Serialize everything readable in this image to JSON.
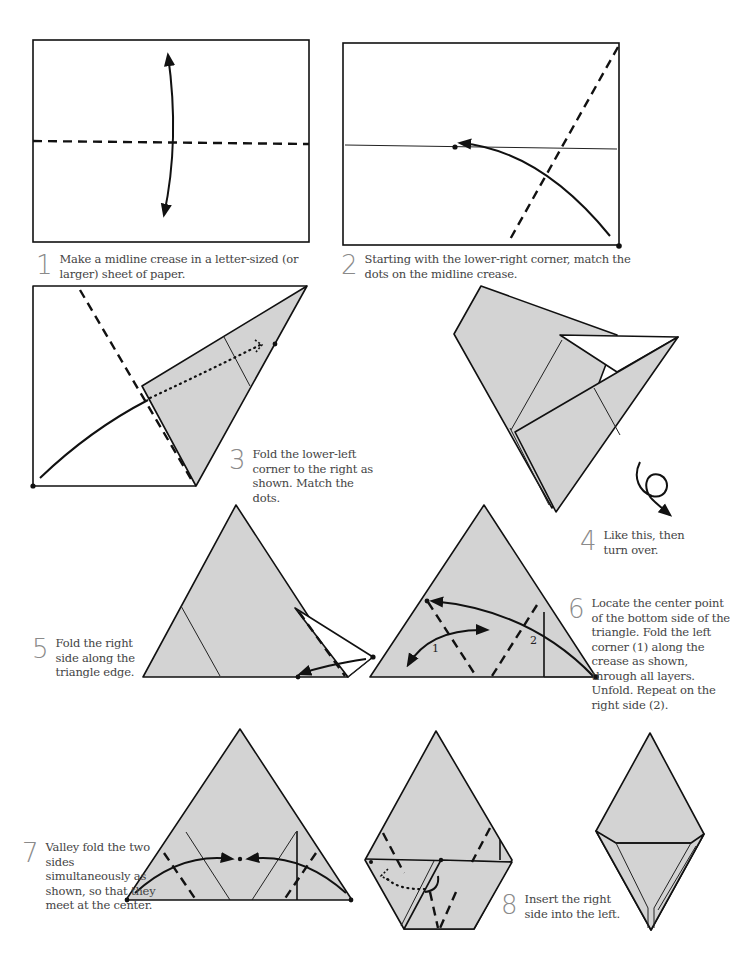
{
  "steps": [
    {
      "number": "1",
      "text": "Make a midline crease in a letter-sized (or larger) sheet of paper."
    },
    {
      "number": "2",
      "text": "Starting with the lower-right corner, match the dots on the midline crease."
    },
    {
      "number": "3",
      "text": "Fold the lower-left corner to the right as shown. Match the dots."
    },
    {
      "number": "4",
      "text": "Like this, then turn over."
    },
    {
      "number": "5",
      "text": "Fold the right side along the triangle edge."
    },
    {
      "number": "6",
      "text": "Locate the center point of the bottom side of the triangle. Fold the left corner (1) along the crease as shown, through all layers. Unfold. Repeat on the right side (2)."
    },
    {
      "number": "7",
      "text": "Valley fold the two sides simultaneously as shown, so that they meet at the center."
    },
    {
      "number": "8",
      "text": "Insert the right side into the left."
    }
  ],
  "diagram_labels": {
    "corner_1": "1",
    "corner_2": "2"
  },
  "colors": {
    "paper": "#d3d3d3",
    "line": "#111111",
    "step_number": "#8a8a8a"
  }
}
